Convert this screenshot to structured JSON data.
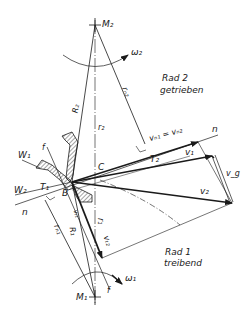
{
  "diagram": {
    "title_faint": "",
    "colors": {
      "ink": "#1a1a1a",
      "background": "#ffffff"
    },
    "centers": {
      "M2": "M₂",
      "M1": "M₁"
    },
    "rotation": {
      "omega2": "ω₂",
      "omega1": "ω₁"
    },
    "wheels": {
      "wheel2_line1": "Rad 2",
      "wheel2_line2": "getrieben",
      "wheel1_line1": "Rad 1",
      "wheel1_line2": "treibend"
    },
    "radii": {
      "R2": "R₂",
      "r2": "r₂",
      "rn2": "rₙ₂",
      "R1": "R₁",
      "r1": "r₁",
      "rn1": "rₙ₁"
    },
    "points": {
      "C": "C",
      "B": "B"
    },
    "lines": {
      "n_right": "n",
      "n_left": "n",
      "W1": "W₁",
      "W2": "W₂",
      "T1": "T₁",
      "T2": "T₂",
      "f_top": "f",
      "f_bottom": "f"
    },
    "vectors": {
      "vn": "vₙ₁ = vₙ₂",
      "v1": "v₁",
      "v2": "v₂",
      "vg": "v_g",
      "vt1": "vₜ₁",
      "vt2": "vₜ₂"
    }
  }
}
